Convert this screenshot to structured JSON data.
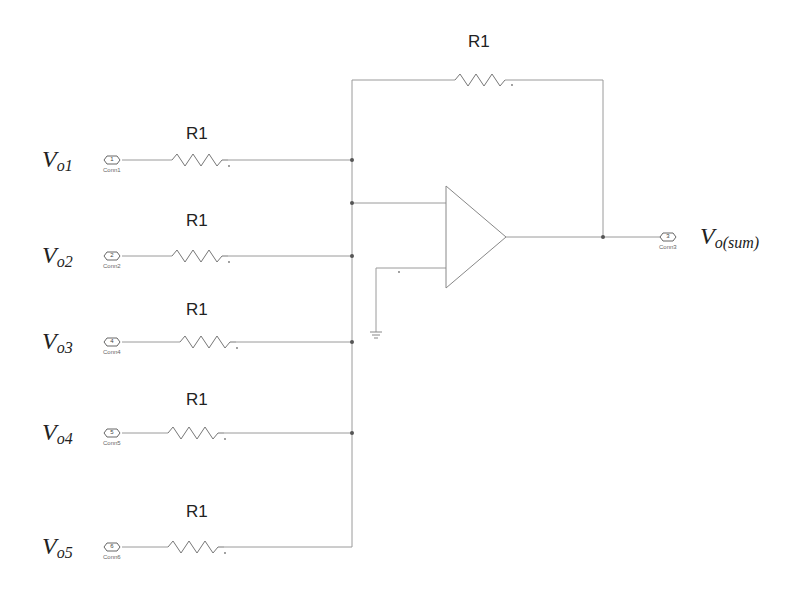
{
  "diagram": {
    "colors": {
      "wire": "#999999",
      "symbol": "#777777",
      "text": "#222222",
      "junction": "#555555"
    },
    "feedback_resistor": {
      "label": "R1"
    },
    "inputs": [
      {
        "label_main": "V",
        "label_sub": "o1",
        "resistor": "R1",
        "port_number": "1",
        "port_name": "Conn1"
      },
      {
        "label_main": "V",
        "label_sub": "o2",
        "resistor": "R1",
        "port_number": "2",
        "port_name": "Conn2"
      },
      {
        "label_main": "V",
        "label_sub": "o3",
        "resistor": "R1",
        "port_number": "4",
        "port_name": "Conn4"
      },
      {
        "label_main": "V",
        "label_sub": "o4",
        "resistor": "R1",
        "port_number": "5",
        "port_name": "Conn5"
      },
      {
        "label_main": "V",
        "label_sub": "o5",
        "resistor": "R1",
        "port_number": "6",
        "port_name": "Conn6"
      }
    ],
    "output": {
      "label_main": "V",
      "label_sub": "o(sum)",
      "port_number": "3",
      "port_name": "Conn3"
    },
    "opamp": {
      "name": "op-amp"
    },
    "ground": {
      "name": "ground"
    }
  }
}
